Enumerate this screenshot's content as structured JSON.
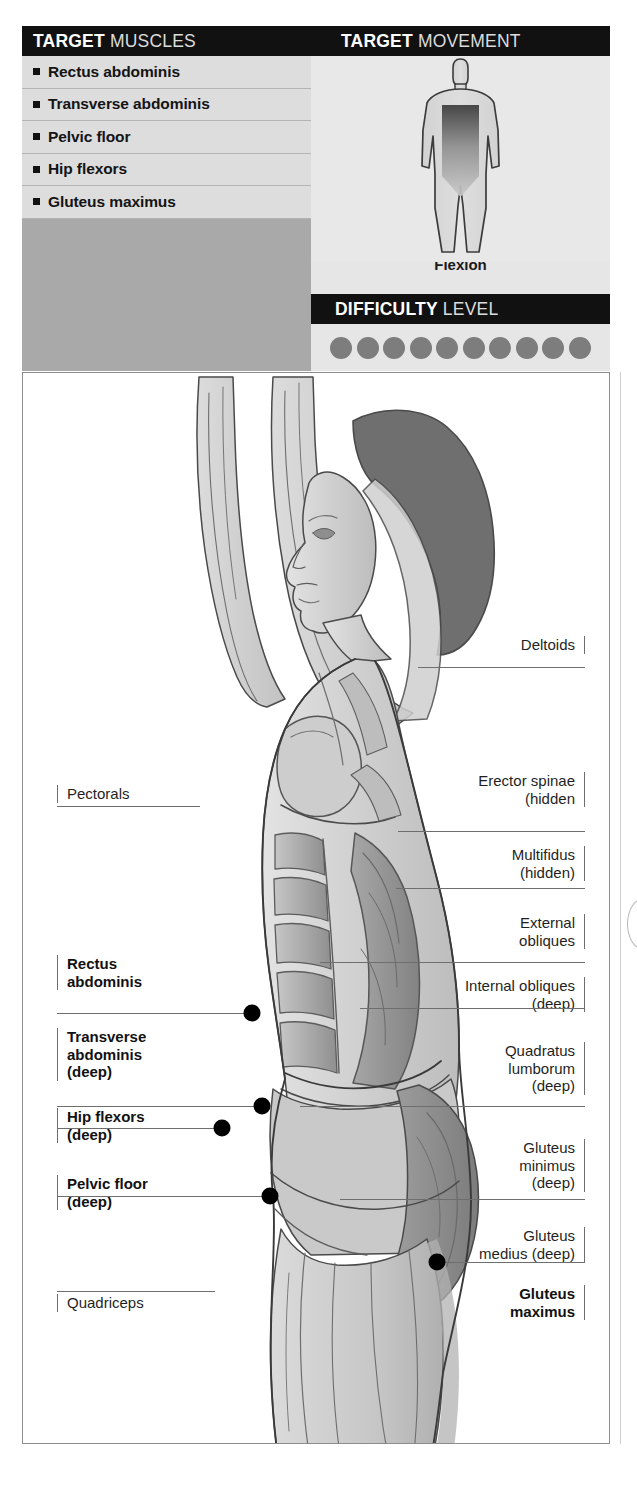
{
  "target_muscles": {
    "header_strong": "TARGET",
    "header_light": "MUSCLES",
    "items": [
      {
        "label": "Rectus abdominis"
      },
      {
        "label": "Transverse abdominis"
      },
      {
        "label": "Pelvic floor"
      },
      {
        "label": "Hip flexors"
      },
      {
        "label": "Gluteus maximus"
      }
    ]
  },
  "target_movement": {
    "header_strong": "TARGET",
    "header_light": "MOVEMENT",
    "caption": "Flexion",
    "figure_icon": "body-silhouette-flexion-arrow"
  },
  "difficulty": {
    "header_strong": "DIFFICULTY",
    "header_light": "LEVEL",
    "total_dots": 10,
    "filled_dots": 10,
    "dot_color": "#7d7d7d"
  },
  "illustration": {
    "figure_description": "anatomical-female-figure-arms-overhead-lateral-view",
    "markers": [
      {
        "name": "rectus-abdominis-marker",
        "x": 252,
        "y": 1013
      },
      {
        "name": "transverse-abdominis-marker",
        "x": 262,
        "y": 1106
      },
      {
        "name": "hip-flexors-marker",
        "x": 222,
        "y": 1128
      },
      {
        "name": "pelvic-floor-marker",
        "x": 270,
        "y": 1196
      },
      {
        "name": "gluteus-maximus-marker",
        "x": 437,
        "y": 1262
      }
    ],
    "labels_left": [
      {
        "name": "pectorals",
        "text": "Pectorals",
        "bold": false,
        "x": 57,
        "y": 785,
        "w": 120,
        "h": 22,
        "leader_to_x": 200,
        "leader_y": 806
      },
      {
        "name": "rectus-abdominis",
        "text": "Rectus\nabdominis",
        "bold": true,
        "x": 57,
        "y": 955,
        "w": 130,
        "h": 42,
        "leader_to_x": 252,
        "leader_y": 1013
      },
      {
        "name": "transverse-abdominis",
        "text": "Transverse\nabdominis\n(deep)",
        "bold": true,
        "x": 57,
        "y": 1028,
        "w": 130,
        "h": 60,
        "leader_to_x": 262,
        "leader_y": 1106
      },
      {
        "name": "hip-flexors",
        "text": "Hip flexors\n(deep)",
        "bold": true,
        "x": 57,
        "y": 1108,
        "w": 130,
        "h": 42,
        "leader_to_x": 222,
        "leader_y": 1128
      },
      {
        "name": "pelvic-floor",
        "text": "Pelvic floor\n(deep)",
        "bold": true,
        "x": 57,
        "y": 1175,
        "w": 130,
        "h": 42,
        "leader_to_x": 270,
        "leader_y": 1196
      },
      {
        "name": "quadriceps",
        "text": "Quadriceps",
        "bold": false,
        "x": 57,
        "y": 1294,
        "w": 140,
        "h": 22,
        "leader_to_x": 215,
        "leader_y": 1291
      }
    ],
    "labels_right": [
      {
        "name": "deltoids",
        "text": "Deltoids",
        "bold": false,
        "x": 455,
        "y": 636,
        "w": 130,
        "h": 22,
        "leader_to_x": 418,
        "leader_y": 667
      },
      {
        "name": "erector-spinae",
        "text": "Erector spinae\n(hidden",
        "bold": false,
        "x": 440,
        "y": 772,
        "w": 145,
        "h": 42,
        "leader_to_x": 398,
        "leader_y": 831
      },
      {
        "name": "multifidus",
        "text": "Multifidus\n(hidden)",
        "bold": false,
        "x": 440,
        "y": 846,
        "w": 145,
        "h": 42,
        "leader_to_x": 396,
        "leader_y": 888
      },
      {
        "name": "external-obliques",
        "text": "External\nobliques",
        "bold": false,
        "x": 440,
        "y": 914,
        "w": 145,
        "h": 42,
        "leader_to_x": 320,
        "leader_y": 962
      },
      {
        "name": "internal-obliques",
        "text": "Internal obliques\n(deep)",
        "bold": false,
        "x": 440,
        "y": 977,
        "w": 145,
        "h": 42,
        "leader_to_x": 360,
        "leader_y": 1008
      },
      {
        "name": "quadratus-lumborum",
        "text": "Quadratus\nlumborum\n(deep)",
        "bold": false,
        "x": 440,
        "y": 1042,
        "w": 145,
        "h": 60,
        "leader_to_x": 300,
        "leader_y": 1106
      },
      {
        "name": "gluteus-minimus",
        "text": "Gluteus\nminimus\n(deep)",
        "bold": false,
        "x": 440,
        "y": 1139,
        "w": 145,
        "h": 60,
        "leader_to_x": 340,
        "leader_y": 1199
      },
      {
        "name": "gluteus-medius",
        "text": "Gluteus\nmedius (deep)",
        "bold": false,
        "x": 440,
        "y": 1227,
        "w": 145,
        "h": 42,
        "leader_to_x": 437,
        "leader_y": 1262
      },
      {
        "name": "gluteus-maximus",
        "text": "Gluteus\nmaximus",
        "bold": true,
        "x": 440,
        "y": 1285,
        "w": 145,
        "h": 42,
        "leader_to_x": 437,
        "leader_y": 1262
      }
    ]
  }
}
